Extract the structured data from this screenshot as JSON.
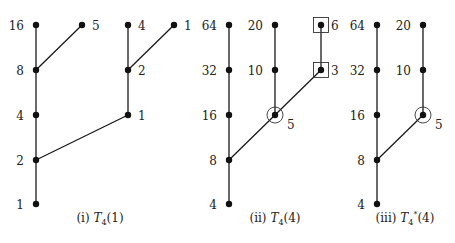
{
  "figure": {
    "panels": [
      {
        "id": "panel-i",
        "caption": {
          "prefix": "(i) ",
          "symbol": "T",
          "sub": "4",
          "sup": "",
          "arg": "(1)"
        },
        "caption_pos": [
          100,
          222
        ],
        "nodes": [
          {
            "id": "a16",
            "label": "16",
            "x": 36,
            "y": 25,
            "label_side": "left"
          },
          {
            "id": "a8",
            "label": "8",
            "x": 36,
            "y": 70,
            "label_side": "left"
          },
          {
            "id": "a4",
            "label": "4",
            "x": 36,
            "y": 115,
            "label_side": "left"
          },
          {
            "id": "a2",
            "label": "2",
            "x": 36,
            "y": 160,
            "label_side": "left"
          },
          {
            "id": "a1",
            "label": "1",
            "x": 36,
            "y": 204,
            "label_side": "left"
          },
          {
            "id": "a5",
            "label": "5",
            "x": 82,
            "y": 25,
            "label_side": "right"
          },
          {
            "id": "b4",
            "label": "4",
            "x": 128,
            "y": 25,
            "label_side": "right"
          },
          {
            "id": "b2",
            "label": "2",
            "x": 128,
            "y": 70,
            "label_side": "right"
          },
          {
            "id": "b1",
            "label": "1",
            "x": 128,
            "y": 115,
            "label_side": "right"
          },
          {
            "id": "c1",
            "label": "1",
            "x": 174,
            "y": 25,
            "label_side": "right"
          }
        ],
        "edges": [
          [
            "a16",
            "a8"
          ],
          [
            "a8",
            "a4"
          ],
          [
            "a4",
            "a2"
          ],
          [
            "a2",
            "a1"
          ],
          [
            "a8",
            "a5"
          ],
          [
            "b4",
            "b2"
          ],
          [
            "b2",
            "b1"
          ],
          [
            "b2",
            "c1"
          ],
          [
            "a2",
            "b1"
          ]
        ]
      },
      {
        "id": "panel-ii",
        "caption": {
          "prefix": "(ii) ",
          "symbol": "T",
          "sub": "4",
          "sup": "",
          "arg": "(4)"
        },
        "caption_pos": [
          275,
          222
        ],
        "nodes": [
          {
            "id": "p64",
            "label": "64",
            "x": 229,
            "y": 25,
            "label_side": "left"
          },
          {
            "id": "p32",
            "label": "32",
            "x": 229,
            "y": 70,
            "label_side": "left"
          },
          {
            "id": "p16",
            "label": "16",
            "x": 229,
            "y": 115,
            "label_side": "left"
          },
          {
            "id": "p8",
            "label": "8",
            "x": 229,
            "y": 160,
            "label_side": "left"
          },
          {
            "id": "p4",
            "label": "4",
            "x": 229,
            "y": 204,
            "label_side": "left"
          },
          {
            "id": "q20",
            "label": "20",
            "x": 275,
            "y": 25,
            "label_side": "left"
          },
          {
            "id": "q10",
            "label": "10",
            "x": 275,
            "y": 70,
            "label_side": "left"
          },
          {
            "id": "q5",
            "label": "5",
            "x": 275,
            "y": 115,
            "label_side": "below-right",
            "marker": "circle"
          },
          {
            "id": "r6",
            "label": "6",
            "x": 321,
            "y": 25,
            "label_side": "right",
            "marker": "square"
          },
          {
            "id": "r3",
            "label": "3",
            "x": 321,
            "y": 70,
            "label_side": "right",
            "marker": "square"
          }
        ],
        "edges": [
          [
            "p64",
            "p32"
          ],
          [
            "p32",
            "p16"
          ],
          [
            "p16",
            "p8"
          ],
          [
            "p8",
            "p4"
          ],
          [
            "q20",
            "q10"
          ],
          [
            "q10",
            "q5"
          ],
          [
            "r6",
            "r3"
          ],
          [
            "p8",
            "r3"
          ]
        ]
      },
      {
        "id": "panel-iii",
        "caption": {
          "prefix": "(iii) ",
          "symbol": "T",
          "sub": "4",
          "sup": "*",
          "arg": "(4)"
        },
        "caption_pos": [
          405,
          222
        ],
        "nodes": [
          {
            "id": "s64",
            "label": "64",
            "x": 377,
            "y": 25,
            "label_side": "left"
          },
          {
            "id": "s32",
            "label": "32",
            "x": 377,
            "y": 70,
            "label_side": "left"
          },
          {
            "id": "s16",
            "label": "16",
            "x": 377,
            "y": 115,
            "label_side": "left"
          },
          {
            "id": "s8",
            "label": "8",
            "x": 377,
            "y": 160,
            "label_side": "left"
          },
          {
            "id": "s4",
            "label": "4",
            "x": 377,
            "y": 204,
            "label_side": "left"
          },
          {
            "id": "t20",
            "label": "20",
            "x": 423,
            "y": 25,
            "label_side": "left"
          },
          {
            "id": "t10",
            "label": "10",
            "x": 423,
            "y": 70,
            "label_side": "left"
          },
          {
            "id": "t5",
            "label": "5",
            "x": 423,
            "y": 115,
            "label_side": "below-right",
            "marker": "circle"
          }
        ],
        "edges": [
          [
            "s64",
            "s32"
          ],
          [
            "s32",
            "s16"
          ],
          [
            "s16",
            "s8"
          ],
          [
            "s8",
            "s4"
          ],
          [
            "t20",
            "t10"
          ],
          [
            "t10",
            "t5"
          ],
          [
            "s8",
            "t5"
          ]
        ]
      }
    ]
  }
}
